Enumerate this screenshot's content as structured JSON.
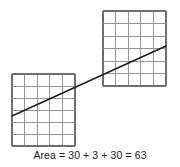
{
  "figure": {
    "background_color": "#ffffff",
    "grid_line_color": "#8c8c8c",
    "grid_border_color": "#6e6e6e",
    "diagonal_line_color": "#1a1a1a",
    "grid_cell_size_px": 12.6,
    "upper_grid": {
      "name": "upper-right-grid",
      "columns": 5,
      "rows": 6,
      "x": 103,
      "y": 11,
      "width": 63,
      "height": 75
    },
    "lower_grid": {
      "name": "lower-left-grid",
      "columns": 5,
      "rows": 6,
      "x": 12,
      "y": 74,
      "width": 63,
      "height": 72
    },
    "diagonal_line": {
      "name": "hypotenuse",
      "x1": 12,
      "y1": 116,
      "x2": 166,
      "y2": 46
    }
  },
  "caption": {
    "text": "Area = 30 + 3 + 30 = 63"
  },
  "chart_data": {
    "type": "table",
    "title": "Area = 30 + 3 + 30 = 63",
    "terms": [
      30,
      3,
      30
    ],
    "total": 63,
    "shapes": [
      {
        "label": "lower-left-grid",
        "columns": 5,
        "rows": 6,
        "cells": 30
      },
      {
        "label": "overlap-strip",
        "cells": 3
      },
      {
        "label": "upper-right-grid",
        "columns": 5,
        "rows": 6,
        "cells": 30
      }
    ]
  }
}
